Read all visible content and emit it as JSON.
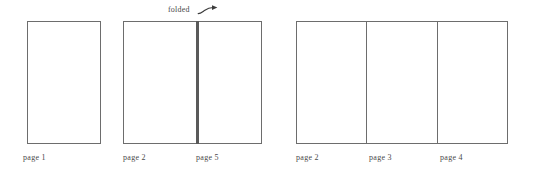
{
  "figure": {
    "annotation": {
      "label": "folded",
      "arrow_icon": "curved-arrow-right-icon"
    },
    "ink_color": "#6d6d6d",
    "fold_color": "#5a5a5a",
    "text_color": "#4a4a4a",
    "background": "#ffffff",
    "diagrams": [
      {
        "name": "single-leaf",
        "panels": [
          {
            "label": "page 1"
          }
        ]
      },
      {
        "name": "folded-spread",
        "panels": [
          {
            "label": "page 2"
          },
          {
            "label": "page 5"
          }
        ]
      },
      {
        "name": "open-sheet",
        "panels": [
          {
            "label": "page 2"
          },
          {
            "label": "page 3"
          },
          {
            "label": "page 4"
          }
        ]
      }
    ]
  }
}
